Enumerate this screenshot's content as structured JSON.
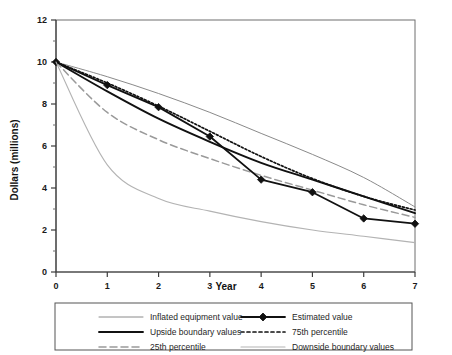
{
  "chart_data": {
    "type": "line",
    "title": "",
    "xlabel": "Year",
    "ylabel": "Dollars (millions)",
    "xlim": [
      0,
      7
    ],
    "ylim": [
      0,
      12
    ],
    "xticks": [
      0,
      1,
      2,
      3,
      4,
      5,
      6,
      7
    ],
    "xtick_labels": [
      "0",
      "1",
      "2",
      "3",
      "4",
      "5",
      "6",
      "7"
    ],
    "yticks": [
      0,
      2,
      4,
      6,
      8,
      10,
      12
    ],
    "ytick_labels": [
      "0",
      "2",
      "4",
      "6",
      "8",
      "10",
      "12"
    ],
    "yminor_ticks": [
      1,
      3,
      5,
      7,
      9,
      11
    ],
    "grid": false,
    "legend_position": "below",
    "x": [
      0,
      1,
      2,
      3,
      4,
      5,
      6,
      7
    ],
    "series": [
      {
        "name": "Inflated equipment value",
        "style": "solid-thin-gray",
        "color": "#8a8a8a",
        "values": [
          10.0,
          9.3,
          8.5,
          7.6,
          6.6,
          5.6,
          4.5,
          3.1
        ]
      },
      {
        "name": "Upside boundary values",
        "style": "solid-thick-black",
        "color": "#111111",
        "values": [
          10.0,
          8.6,
          7.3,
          6.2,
          5.2,
          4.4,
          3.6,
          2.8
        ]
      },
      {
        "name": "25th percentile",
        "style": "dashed-gray",
        "color": "#9a9a9a",
        "values": [
          10.0,
          7.6,
          6.3,
          5.4,
          4.6,
          3.9,
          3.2,
          2.6
        ]
      },
      {
        "name": "Estimated value",
        "style": "solid-black-diamond",
        "color": "#111111",
        "marker": "diamond",
        "values": [
          10.0,
          8.9,
          7.85,
          6.45,
          4.4,
          3.8,
          2.55,
          2.3
        ]
      },
      {
        "name": "75th percentile",
        "style": "dotted-black",
        "color": "#111111",
        "values": [
          10.0,
          9.0,
          7.9,
          6.7,
          5.5,
          4.45,
          3.6,
          2.95
        ]
      },
      {
        "name": "Downside boundary values",
        "style": "solid-thin-lightgray",
        "color": "#b3b3b3",
        "values": [
          10.0,
          5.1,
          3.5,
          2.9,
          2.4,
          2.0,
          1.7,
          1.4
        ]
      }
    ]
  },
  "legend": {
    "column_left": [
      {
        "label": "Inflated equipment value",
        "swatch": "solid-thin-gray"
      },
      {
        "label": "Upside boundary values",
        "swatch": "solid-thick-black"
      },
      {
        "label": "25th percentile",
        "swatch": "dashed-gray"
      }
    ],
    "column_right": [
      {
        "label": "Estimated value",
        "swatch": "solid-black-diamond"
      },
      {
        "label": "75th percentile",
        "swatch": "dotted-black"
      },
      {
        "label": "Downside boundary values",
        "swatch": "solid-thin-lightgray"
      }
    ]
  }
}
